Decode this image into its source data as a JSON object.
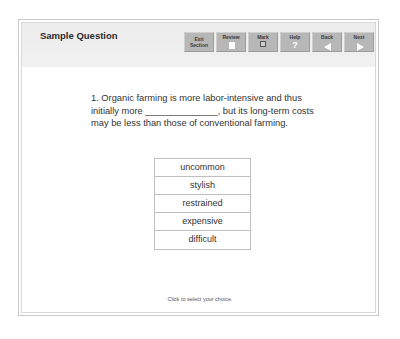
{
  "header": {
    "title": "Sample Question"
  },
  "toolbar": {
    "buttons": [
      {
        "id": "exit-section",
        "label_line1": "Exit",
        "label_line2": "Section"
      },
      {
        "id": "review",
        "label": "Review",
        "icon": "document-icon"
      },
      {
        "id": "mark",
        "label": "Mark",
        "icon": "checkbox-icon"
      },
      {
        "id": "help",
        "label": "Help",
        "icon": "question-icon",
        "glyph": "?"
      },
      {
        "id": "back",
        "label": "Back",
        "icon": "arrow-left-icon"
      },
      {
        "id": "next",
        "label": "Next",
        "icon": "arrow-right-icon"
      }
    ]
  },
  "question": {
    "line1": "1. Organic farming is more labor-intensive and thus",
    "line2": "initially more ______________, but its long-term costs",
    "line3": "may be less than those of conventional farming."
  },
  "choices": [
    "uncommon",
    "stylish",
    "restrained",
    "expensive",
    "difficult"
  ],
  "footer": {
    "hint": "Click to select your choice."
  }
}
